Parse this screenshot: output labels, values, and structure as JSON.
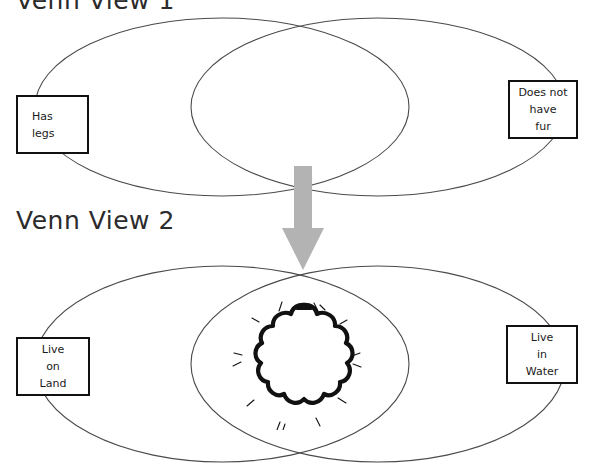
{
  "page": {
    "background_color": "#ffffff",
    "width": 593,
    "height": 468
  },
  "sections": [
    {
      "id": "venn-view-1",
      "title": "Venn View 1",
      "title_color": "#2b2b2b",
      "left_label": {
        "lines": [
          "Has",
          "legs"
        ],
        "text": "Has legs"
      },
      "right_label": {
        "lines": [
          "Does not",
          "have",
          "fur"
        ],
        "text": "Does not have fur"
      },
      "ellipse_stroke": "#4a4a4a",
      "ellipses": [
        {
          "cx": 222,
          "cy": 107,
          "rx": 187,
          "ry": 89
        },
        {
          "cx": 378,
          "cy": 107,
          "rx": 187,
          "ry": 89
        }
      ]
    },
    {
      "id": "venn-view-2",
      "title": "Venn View 2",
      "title_color": "#2b2b2b",
      "left_label": {
        "lines": [
          "Live",
          "on",
          "Land"
        ],
        "text": "Live on Land"
      },
      "right_label": {
        "lines": [
          "Live",
          "in",
          "Water"
        ],
        "text": "Live in Water"
      },
      "ellipse_stroke": "#4a4a4a",
      "ellipses": [
        {
          "cx": 222,
          "cy": 364,
          "rx": 187,
          "ry": 98
        },
        {
          "cx": 378,
          "cy": 364,
          "rx": 187,
          "ry": 98
        }
      ]
    }
  ],
  "arrow": {
    "name": "down-arrow",
    "color": "#b3b3b3",
    "direction": "down",
    "x": 276,
    "y": 166,
    "width": 54,
    "height": 105
  },
  "highlight": {
    "name": "cloud-burst-highlight",
    "shape": "cloud",
    "stroke_color": "#111111",
    "fill_color": "#ffffff",
    "x": 232,
    "y": 300,
    "width": 130,
    "height": 130,
    "location": "intersection-of-venn-view-2"
  },
  "box_style": {
    "border_color": "#111111",
    "fill_color": "#ffffff",
    "text_color": "#1a1a1a"
  }
}
